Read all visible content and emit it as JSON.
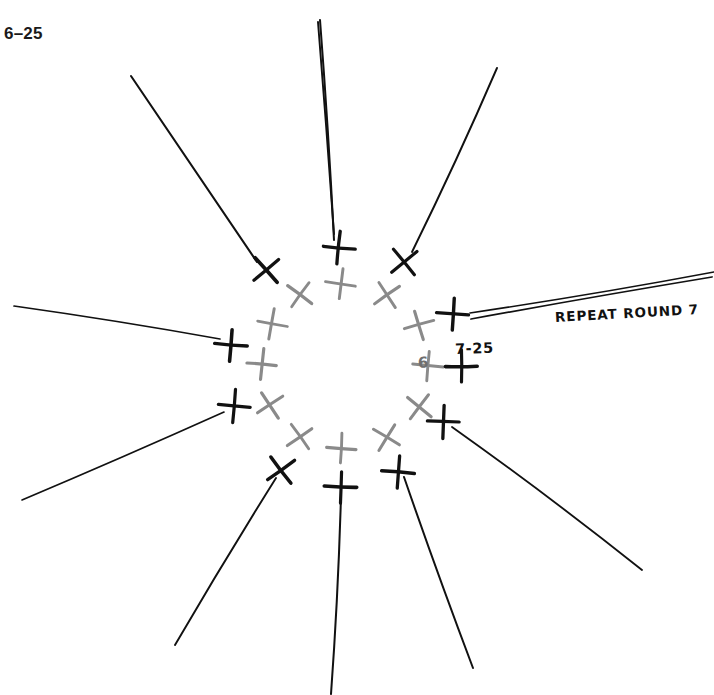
{
  "figure": {
    "number_label": "6–25",
    "background_color": "#ffffff",
    "center": {
      "x": 346,
      "y": 366
    }
  },
  "annotations": {
    "repeat_note": "REPEAT ROUND 7",
    "round7_label": "7-25",
    "round6_label": "6"
  },
  "colors": {
    "round6_gray": "#8a8a8a",
    "round7_black": "#111111",
    "line_black": "#111111",
    "label_black": "#1a1a1a"
  },
  "legend": {
    "round6_symbol": "gray-cross",
    "round7_symbol": "black-cross",
    "spoke_symbol": "radiating-line"
  },
  "chart_data": {
    "type": "scatter",
    "xlabel": "",
    "ylabel": "",
    "grid": false,
    "legend_position": "none",
    "center": {
      "x": 346,
      "y": 366
    },
    "counts": {
      "round6_stitches": 12,
      "round7_stitches": 12,
      "spokes": 12
    },
    "series": [
      {
        "name": "Round 6 stitches (gray crosses)",
        "symbol": "cross",
        "color": "#8a8a8a",
        "radius": 82,
        "count": 12,
        "points": [
          {
            "angle": -90,
            "x": 341,
            "y": 284,
            "tilt": 8
          },
          {
            "angle": -60,
            "x": 387,
            "y": 295,
            "tilt": -34
          },
          {
            "angle": -30,
            "x": 419,
            "y": 325,
            "tilt": -16
          },
          {
            "angle": 0,
            "x": 428,
            "y": 366,
            "tilt": 6
          },
          {
            "angle": 30,
            "x": 419,
            "y": 407,
            "tilt": 38
          },
          {
            "angle": 60,
            "x": 387,
            "y": 437,
            "tilt": 32
          },
          {
            "angle": 90,
            "x": 341,
            "y": 448,
            "tilt": 4
          },
          {
            "angle": 120,
            "x": 300,
            "y": 437,
            "tilt": -36
          },
          {
            "angle": 150,
            "x": 270,
            "y": 405,
            "tilt": -34
          },
          {
            "angle": 180,
            "x": 262,
            "y": 364,
            "tilt": 6
          },
          {
            "angle": 210,
            "x": 272,
            "y": 324,
            "tilt": 10
          },
          {
            "angle": 240,
            "x": 300,
            "y": 295,
            "tilt": 36
          }
        ]
      },
      {
        "name": "Round 7 stitches (black crosses)",
        "symbol": "cross",
        "color": "#111111",
        "radius": 118,
        "count": 12,
        "points": [
          {
            "angle": -90,
            "x": 339,
            "y": 248,
            "tilt": 6
          },
          {
            "angle": -60,
            "x": 404,
            "y": 262,
            "tilt": -40
          },
          {
            "angle": -30,
            "x": 453,
            "y": 314,
            "tilt": 4
          },
          {
            "angle": 0,
            "x": 461,
            "y": 366,
            "tilt": 0
          },
          {
            "angle": 30,
            "x": 443,
            "y": 422,
            "tilt": 2
          },
          {
            "angle": 60,
            "x": 398,
            "y": 472,
            "tilt": 4
          },
          {
            "angle": 90,
            "x": 341,
            "y": 487,
            "tilt": 2
          },
          {
            "angle": 120,
            "x": 281,
            "y": 470,
            "tilt": -36
          },
          {
            "angle": 150,
            "x": 234,
            "y": 406,
            "tilt": 6
          },
          {
            "angle": 180,
            "x": 231,
            "y": 345,
            "tilt": 4
          },
          {
            "angle": 210,
            "x": 266,
            "y": 270,
            "tilt": -40
          },
          {
            "angle": 240,
            "x": 265,
            "y": 268,
            "tilt": -40
          }
        ]
      },
      {
        "name": "Radiating spokes (chain lines)",
        "symbol": "line",
        "color": "#111111",
        "count": 12,
        "segments": [
          {
            "x1": 334,
            "y1": 234,
            "x2": 318,
            "y2": 22
          },
          {
            "x1": 412,
            "y1": 252,
            "x2": 497,
            "y2": 68
          },
          {
            "x1": 470,
            "y1": 313,
            "x2": 714,
            "y2": 272
          },
          {
            "x1": 471,
            "y1": 319,
            "x2": 712,
            "y2": 277
          },
          {
            "x1": 452,
            "y1": 427,
            "x2": 642,
            "y2": 570
          },
          {
            "x1": 404,
            "y1": 477,
            "x2": 473,
            "y2": 668
          },
          {
            "x1": 341,
            "y1": 496,
            "x2": 331,
            "y2": 694
          },
          {
            "x1": 276,
            "y1": 478,
            "x2": 175,
            "y2": 645
          },
          {
            "x1": 224,
            "y1": 412,
            "x2": 22,
            "y2": 500
          },
          {
            "x1": 220,
            "y1": 339,
            "x2": 14,
            "y2": 306
          },
          {
            "x1": 257,
            "y1": 262,
            "x2": 131,
            "y2": 76
          },
          {
            "x1": 334,
            "y1": 240,
            "x2": 320,
            "y2": 20
          }
        ]
      }
    ]
  }
}
